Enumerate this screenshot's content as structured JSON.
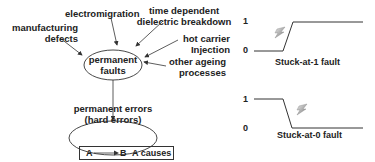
{
  "left_diagram": {
    "causes": [
      {
        "id": "manufacturing",
        "line1": "manufacturing",
        "line2": "defects"
      },
      {
        "id": "electromigration",
        "line1": "electromigration"
      },
      {
        "id": "tddb",
        "line1": "time dependent",
        "line2": "dielectric breakdown"
      },
      {
        "id": "hot_carrier",
        "line1": "hot carrier",
        "line2": "Injection"
      },
      {
        "id": "ageing",
        "line1": "other ageing",
        "line2": "processes"
      }
    ],
    "center_node": {
      "line1": "permanent",
      "line2": "faults"
    },
    "result_node": {
      "line1": "permanent errors",
      "line2": "(hard errors)"
    },
    "legend": {
      "a": "A",
      "b": "B",
      "text": "A causes B"
    }
  },
  "right_diagram": {
    "stuck_at_1": {
      "level_high": "1",
      "level_low": "0",
      "caption": "Stuck-at-1 fault"
    },
    "stuck_at_0": {
      "level_high": "1",
      "level_low": "0",
      "caption": "Stuck-at-0 fault"
    }
  },
  "colors": {
    "line": "#333333",
    "text": "#222222",
    "background": "#ffffff"
  }
}
